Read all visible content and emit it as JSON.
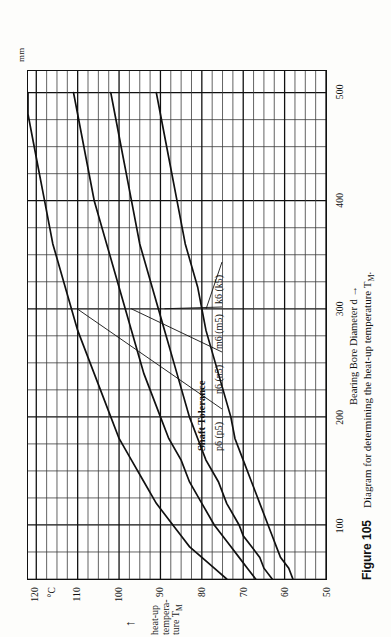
{
  "figure": {
    "number": "Figure 105",
    "caption_text": "Diagram for determining the heat-up temperature T",
    "caption_sub": "M",
    "caption_end": "."
  },
  "axes": {
    "x": {
      "label": "Bearing Bore Diameter d →",
      "unit": "mm",
      "ticks": [
        "100",
        "200",
        "300",
        "400",
        "500"
      ],
      "tick_values": [
        100,
        200,
        300,
        400,
        500
      ],
      "range": [
        50,
        520
      ],
      "minor_step": 50
    },
    "y": {
      "label_line1": "heat-up",
      "label_line2": "tempera-",
      "label_line3": "ture T",
      "label_sub": "M",
      "unit": "°C",
      "arrow": "↑",
      "ticks": [
        "120",
        "110",
        "100",
        "90",
        "80",
        "70",
        "60",
        "50"
      ],
      "tick_values": [
        120,
        110,
        100,
        90,
        80,
        70,
        60,
        50
      ],
      "range": [
        50,
        122
      ],
      "minor_step": 5
    }
  },
  "annotations": {
    "legend_title": "Shaft Tolerance",
    "curve_labels": [
      "p6 (p5)",
      "n6 (n5)",
      "m6 (m5)",
      "k6 (k5)"
    ]
  },
  "chart_data": {
    "type": "line",
    "title": "Diagram for determining the heat-up temperature TM",
    "xlabel": "Bearing Bore Diameter d → (mm)",
    "ylabel": "heat-up temperature TM (°C)",
    "xlim": [
      50,
      520
    ],
    "ylim": [
      50,
      122
    ],
    "grid": true,
    "legend": "in-plot labels at right of curves",
    "x": [
      50,
      60,
      70,
      80,
      90,
      100,
      120,
      140,
      160,
      180,
      200,
      240,
      280,
      320,
      360,
      400,
      440,
      480,
      500
    ],
    "series": [
      {
        "name": "p6 (p5)",
        "values": [
          74,
          77,
          80,
          83,
          85,
          87,
          91,
          94,
          97,
          100,
          102,
          106,
          110,
          113,
          116,
          118,
          120,
          122,
          122
        ]
      },
      {
        "name": "n6 (n5)",
        "values": [
          67,
          69,
          71,
          73,
          75,
          77,
          80,
          83,
          85,
          88,
          90,
          94,
          97,
          100,
          103,
          106,
          108,
          110,
          111
        ]
      },
      {
        "name": "m6 (m5)",
        "values": [
          63,
          65,
          66,
          68,
          70,
          71,
          74,
          76,
          79,
          81,
          83,
          86,
          89,
          92,
          95,
          97,
          99,
          101,
          102
        ]
      },
      {
        "name": "k6 (k5)",
        "values": [
          58,
          59,
          61,
          62,
          63,
          64,
          66,
          68,
          70,
          72,
          73,
          76,
          79,
          81,
          84,
          86,
          88,
          90,
          91
        ]
      }
    ]
  }
}
